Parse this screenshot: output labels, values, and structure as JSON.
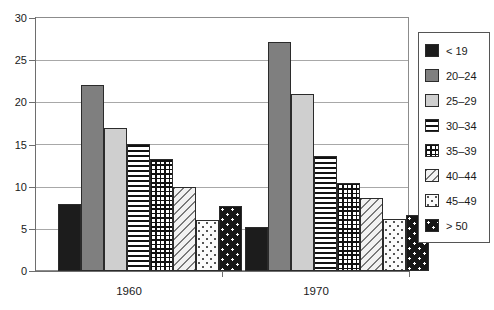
{
  "chart_data": {
    "type": "bar",
    "title": "",
    "xlabel": "",
    "ylabel": "",
    "ylim": [
      0,
      30
    ],
    "yticks": [
      0,
      5,
      10,
      15,
      20,
      25,
      30
    ],
    "grid": true,
    "legend_position": "right",
    "categories": [
      "1960",
      "1970"
    ],
    "series": [
      {
        "name": "< 19",
        "values": [
          8.0,
          5.2
        ],
        "pattern": "solid-black",
        "swatch_class": "p-solid-black"
      },
      {
        "name": "20–24",
        "values": [
          22.0,
          27.2
        ],
        "pattern": "solid-dark-grey",
        "swatch_class": "p-dark-grey"
      },
      {
        "name": "25–29",
        "values": [
          17.0,
          21.0
        ],
        "pattern": "solid-light-grey",
        "swatch_class": "p-light-grey"
      },
      {
        "name": "30–34",
        "values": [
          15.1,
          13.6
        ],
        "pattern": "horizontal-lines",
        "swatch_class": "p-hlines"
      },
      {
        "name": "35–39",
        "values": [
          13.3,
          10.4
        ],
        "pattern": "cross-grid",
        "swatch_class": "p-grid"
      },
      {
        "name": "40–44",
        "values": [
          10.0,
          8.6
        ],
        "pattern": "diagonal-lines",
        "swatch_class": "p-diag"
      },
      {
        "name": "45–49",
        "values": [
          6.0,
          6.2
        ],
        "pattern": "light-dots",
        "swatch_class": "p-dots-light"
      },
      {
        "name": "> 50",
        "values": [
          7.7,
          6.7
        ],
        "pattern": "dark-dots",
        "swatch_class": "p-dots-dark"
      }
    ]
  },
  "axis": {
    "y_tick_labels": [
      "0",
      "5",
      "10",
      "15",
      "20",
      "25",
      "30"
    ],
    "x_tick_labels": [
      "1960",
      "1970"
    ]
  },
  "legend": {
    "items": [
      {
        "label": "< 19"
      },
      {
        "label": "20–24"
      },
      {
        "label": "25–29"
      },
      {
        "label": "30–34"
      },
      {
        "label": "35–39"
      },
      {
        "label": "40–44"
      },
      {
        "label": "45–49"
      },
      {
        "label": "> 50"
      }
    ]
  },
  "colors": {
    "frame": "#8c8c8c",
    "gridline": "#a8a8a8",
    "axis": "#6e6e6e",
    "bar_outline": "#2b2b2b",
    "text": "#1a1a1a",
    "background": "#ffffff"
  }
}
